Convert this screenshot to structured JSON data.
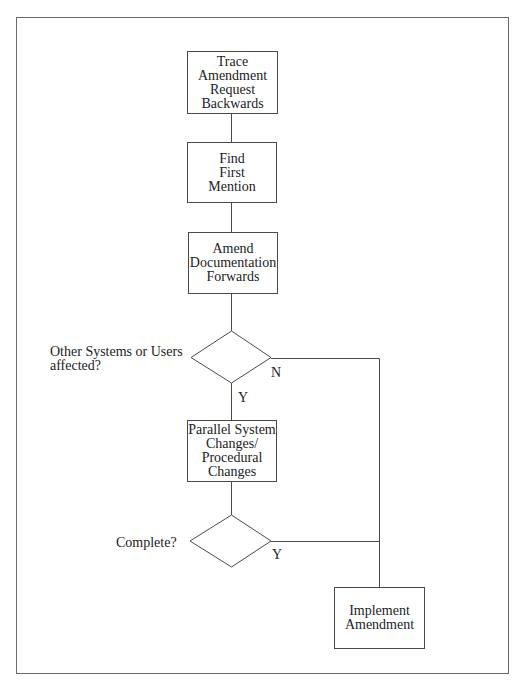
{
  "flowchart": {
    "nodes": [
      {
        "id": "trace",
        "type": "process",
        "text": "Trace\nAmendment\nRequest\nBackwards"
      },
      {
        "id": "find",
        "type": "process",
        "text": "Find\nFirst\nMention"
      },
      {
        "id": "amend",
        "type": "process",
        "text": "Amend\nDocumentation\nForwards"
      },
      {
        "id": "decision1",
        "type": "decision",
        "question": "Other Systems or Users\naffected?",
        "yes_label": "Y",
        "no_label": "N"
      },
      {
        "id": "parallel",
        "type": "process",
        "text": "Parallel System\nChanges/\nProcedural\nChanges"
      },
      {
        "id": "decision2",
        "type": "decision",
        "question": "Complete?",
        "yes_label": "Y"
      },
      {
        "id": "implement",
        "type": "process",
        "text": "Implement\nAmendment"
      }
    ],
    "edges": [
      {
        "from": "trace",
        "to": "find"
      },
      {
        "from": "find",
        "to": "amend"
      },
      {
        "from": "amend",
        "to": "decision1"
      },
      {
        "from": "decision1",
        "to": "parallel",
        "label": "Y"
      },
      {
        "from": "decision1",
        "to": "implement",
        "label": "N"
      },
      {
        "from": "parallel",
        "to": "decision2"
      },
      {
        "from": "decision2",
        "to": "implement",
        "label": "Y"
      }
    ]
  },
  "colors": {
    "line": "#4a4a4a",
    "frame": "#6a6a6a",
    "background": "#ffffff"
  }
}
